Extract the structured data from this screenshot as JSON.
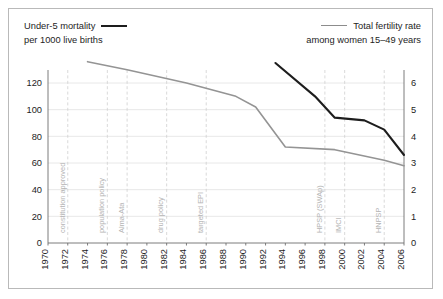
{
  "legend": {
    "left": {
      "line1": "Under-5 mortality",
      "line2": "per 1000 live births",
      "swatch": "black-line-swatch",
      "color": "#1d1d1d"
    },
    "right": {
      "line1": "Total fertility rate",
      "line2": "among women 15–49 years",
      "swatch": "grey-line-swatch",
      "color": "#949494"
    }
  },
  "chart_data": {
    "type": "line",
    "title": "",
    "xlabel": "",
    "ylabel": "",
    "grid": true,
    "legend_position": "top",
    "x": [
      1970,
      1972,
      1974,
      1976,
      1978,
      1980,
      1982,
      1984,
      1986,
      1988,
      1990,
      1992,
      1994,
      1996,
      1998,
      2000,
      2002,
      2004,
      2006
    ],
    "xlim": [
      1970,
      2006
    ],
    "xtick_labels": [
      "1970",
      "1972",
      "1974",
      "1976",
      "1978",
      "1980",
      "1982",
      "1984",
      "1986",
      "1988",
      "1990",
      "1992",
      "1994",
      "1996",
      "1998",
      "2000",
      "2002",
      "2004",
      "2006"
    ],
    "axes": [
      {
        "id": "left",
        "label": "Under-5 mortality per 1000 live births",
        "ylim": [
          0,
          120
        ],
        "ytick_labels": [
          "0",
          "20",
          "40",
          "60",
          "80",
          "100",
          "120"
        ],
        "yticks": [
          0,
          20,
          40,
          60,
          80,
          100,
          120
        ]
      },
      {
        "id": "right",
        "label": "Total fertility rate among women 15–49 years",
        "ylim": [
          0,
          6
        ],
        "ytick_labels": [
          "0",
          "1",
          "2",
          "3",
          "4",
          "5",
          "6"
        ],
        "yticks": [
          0,
          1,
          2,
          3,
          4,
          5,
          6
        ]
      }
    ],
    "series": [
      {
        "name": "Under-5 mortality per 1000 live births",
        "axis": "left",
        "color": "#1d1d1d",
        "x": [
          1993,
          1997,
          1999,
          2002,
          2004,
          2006
        ],
        "values": [
          135,
          110,
          94,
          92,
          85,
          66
        ]
      },
      {
        "name": "Total fertility rate among women 15–49 years",
        "axis": "right",
        "color": "#949494",
        "x": [
          1974,
          1978,
          1984,
          1989,
          1991,
          1994,
          1999,
          2004,
          2006
        ],
        "values": [
          6.8,
          6.5,
          6.0,
          5.5,
          5.1,
          3.6,
          3.5,
          3.1,
          2.9
        ]
      }
    ],
    "annotations": [
      {
        "label": "constitution approved",
        "x": 1972
      },
      {
        "label": "population policy",
        "x": 1976
      },
      {
        "label": "Alma-Ata",
        "x": 1978
      },
      {
        "label": "drug policy",
        "x": 1982
      },
      {
        "label": "targeted EPI",
        "x": 1986
      },
      {
        "label": "HPSP (SWAp)",
        "x": 1998
      },
      {
        "label": "IMCI",
        "x": 2000
      },
      {
        "label": "HNPSP",
        "x": 2004
      }
    ]
  }
}
